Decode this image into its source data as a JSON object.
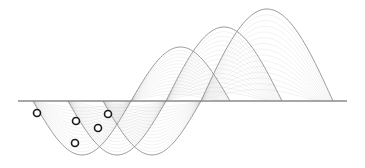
{
  "figure": {
    "type": "wave-diagram",
    "background": "#ffffff",
    "baseline": {
      "x1": 18,
      "x2": 347,
      "y": 101,
      "color": "#8a8a8a"
    },
    "waves": [
      {
        "name": "wave-1",
        "start_x": 33,
        "mid_x": 131,
        "end_x": 230,
        "trough_amp": 54,
        "crest_amp": 54,
        "color": "#9a9a9a"
      },
      {
        "name": "wave-2",
        "start_x": 68,
        "mid_x": 166,
        "end_x": 282,
        "trough_amp": 54,
        "crest_amp": 74,
        "color": "#9a9a9a"
      },
      {
        "name": "wave-3",
        "start_x": 103,
        "mid_x": 201,
        "end_x": 333,
        "trough_amp": 54,
        "crest_amp": 92,
        "color": "#9a9a9a"
      }
    ],
    "markers": [
      {
        "cx": 37,
        "cy": 113
      },
      {
        "cx": 76,
        "cy": 121
      },
      {
        "cx": 75,
        "cy": 143
      },
      {
        "cx": 98,
        "cy": 128
      },
      {
        "cx": 108,
        "cy": 114
      }
    ],
    "marker_style": {
      "r": 3.5,
      "stroke": "#1a1a1a",
      "stroke_width": 1.6,
      "fill": "#ffffff"
    }
  }
}
